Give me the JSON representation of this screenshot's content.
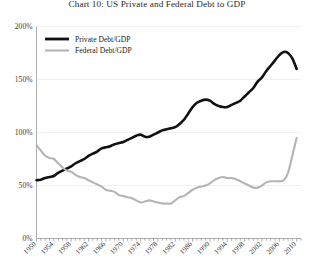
{
  "chart_data": {
    "type": "line",
    "title": "Chart 10: US Private and Federal Debt to GDP",
    "xlabel": "",
    "ylabel": "",
    "ylim": [
      0,
      200
    ],
    "xlim": [
      1950,
      2011
    ],
    "grid": true,
    "y_ticks": [
      0,
      50,
      100,
      150,
      200
    ],
    "y_tick_labels": [
      "0%",
      "50%",
      "100%",
      "150%",
      "200%"
    ],
    "x_ticks": [
      1950,
      1954,
      1958,
      1962,
      1966,
      1970,
      1974,
      1978,
      1982,
      1986,
      1990,
      1994,
      1998,
      2002,
      2006,
      2010
    ],
    "x_tick_labels": [
      "1950",
      "1954",
      "1958",
      "1962",
      "1966",
      "1970",
      "1974",
      "1978",
      "1982",
      "1986",
      "1990",
      "1994",
      "1998",
      "2002",
      "2006",
      "2010"
    ],
    "legend_position": "top-left",
    "series": [
      {
        "name": "Private Debt/GDP",
        "color": "#111111",
        "width": 2.6,
        "x": [
          1950,
          1951,
          1952,
          1953,
          1954,
          1955,
          1956,
          1957,
          1958,
          1959,
          1960,
          1961,
          1962,
          1963,
          1964,
          1965,
          1966,
          1967,
          1968,
          1969,
          1970,
          1971,
          1972,
          1973,
          1974,
          1975,
          1976,
          1977,
          1978,
          1979,
          1980,
          1981,
          1982,
          1983,
          1984,
          1985,
          1986,
          1987,
          1988,
          1989,
          1990,
          1991,
          1992,
          1993,
          1994,
          1995,
          1996,
          1997,
          1998,
          1999,
          2000,
          2001,
          2002,
          2003,
          2004,
          2005,
          2006,
          2007,
          2008,
          2009,
          2010
        ],
        "values": [
          55,
          55.5,
          57,
          58,
          59,
          62,
          64,
          66,
          68,
          71,
          73,
          75,
          78,
          80,
          82,
          85,
          86,
          87,
          89,
          90,
          91,
          93,
          95,
          97,
          98,
          96,
          96,
          98,
          100,
          102,
          103,
          104,
          105,
          108,
          112,
          118,
          124,
          128,
          130,
          131,
          130,
          127,
          125,
          124,
          124,
          126,
          128,
          130,
          134,
          138,
          142,
          148,
          152,
          158,
          163,
          168,
          173,
          176,
          175,
          170,
          160
        ]
      },
      {
        "name": "Federal Debt/GDP",
        "color": "#b4b4b4",
        "width": 2.1,
        "x": [
          1950,
          1951,
          1952,
          1953,
          1954,
          1955,
          1956,
          1957,
          1958,
          1959,
          1960,
          1961,
          1962,
          1963,
          1964,
          1965,
          1966,
          1967,
          1968,
          1969,
          1970,
          1971,
          1972,
          1973,
          1974,
          1975,
          1976,
          1977,
          1978,
          1979,
          1980,
          1981,
          1982,
          1983,
          1984,
          1985,
          1986,
          1987,
          1988,
          1989,
          1990,
          1991,
          1992,
          1993,
          1994,
          1995,
          1996,
          1997,
          1998,
          1999,
          2000,
          2001,
          2002,
          2003,
          2004,
          2005,
          2006,
          2007,
          2008,
          2009,
          2010
        ],
        "values": [
          88,
          83,
          78,
          76,
          75,
          71,
          67,
          64,
          63,
          60,
          58,
          57,
          55,
          53,
          51,
          49,
          46,
          45,
          44,
          41,
          40,
          39,
          38,
          36,
          34,
          35,
          36,
          35,
          34,
          33,
          33,
          33,
          36,
          39,
          40,
          43,
          46,
          48,
          49,
          50,
          52,
          55,
          57,
          58,
          57,
          57,
          56,
          54,
          52,
          50,
          48,
          48,
          50,
          53,
          54,
          54,
          54,
          55,
          62,
          78,
          95
        ]
      }
    ]
  },
  "legend": {
    "items": [
      {
        "label": "Private Debt/GDP",
        "color": "#111111"
      },
      {
        "label": "Federal Debt/GDP",
        "color": "#b4b4b4"
      }
    ]
  }
}
